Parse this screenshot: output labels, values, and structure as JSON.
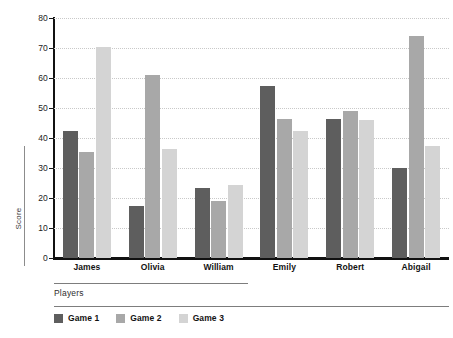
{
  "chart_data": {
    "type": "bar",
    "title": "",
    "xlabel": "Players",
    "ylabel": "Score",
    "categories": [
      "James",
      "Olivia",
      "William",
      "Emily",
      "Robert",
      "Abigail"
    ],
    "series": [
      {
        "name": "Game 1",
        "color": "#5e5e5e",
        "values": [
          42.5,
          17.5,
          23.5,
          57.5,
          46.5,
          30.0
        ]
      },
      {
        "name": "Game 2",
        "color": "#a8a8a8",
        "values": [
          35.5,
          61.0,
          19.0,
          46.5,
          49.0,
          74.0
        ]
      },
      {
        "name": "Game 3",
        "color": "#d4d4d4",
        "values": [
          70.5,
          36.5,
          24.5,
          42.5,
          46.0,
          37.5
        ]
      }
    ],
    "ylim": [
      0,
      80
    ],
    "yticks": [
      0,
      10,
      20,
      30,
      40,
      50,
      60,
      70,
      80
    ],
    "ytick_labels": [
      "0",
      "10",
      "20",
      "30",
      "40",
      "50",
      "60",
      "70",
      "80"
    ],
    "grid": true,
    "grid_axis": "y",
    "grid_style": "dotted",
    "legend_position": "bottom-left",
    "bar_mode": "grouped"
  }
}
